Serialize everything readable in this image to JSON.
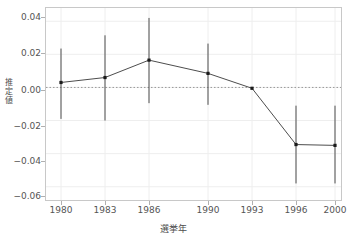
{
  "chart_data": {
    "type": "line",
    "title": "",
    "xlabel": "選挙年",
    "ylabel": "推定値",
    "ylabel_chars": [
      "推",
      "定",
      "値"
    ],
    "categories": [
      "1980",
      "1983",
      "1986",
      "1990",
      "1993",
      "1996",
      "2000"
    ],
    "x": [
      1980,
      1983,
      1986,
      1990,
      1993,
      1996,
      2000
    ],
    "values": [
      0.003,
      0.006,
      0.0165,
      0.0085,
      -0.0005,
      -0.0345,
      -0.035
    ],
    "ci_lower": [
      -0.019,
      -0.02,
      -0.0095,
      -0.0105,
      null,
      -0.058,
      -0.058
    ],
    "ci_upper": [
      0.0235,
      0.0315,
      0.042,
      0.0265,
      null,
      -0.011,
      -0.011
    ],
    "ylim": [
      -0.068,
      0.048
    ],
    "yticks": [
      0.04,
      0.02,
      0.0,
      -0.02,
      -0.04,
      -0.06
    ],
    "ytick_labels": [
      "0.04",
      "0.02",
      "0.00",
      "−0.02",
      "−0.04",
      "−0.06"
    ],
    "xtick_labels": [
      "1980",
      "1983",
      "1986",
      "1990",
      "1993",
      "1996",
      "2000"
    ],
    "grid": true,
    "legend": "none",
    "reference_line": {
      "value": 0.0,
      "style": "dotted"
    },
    "colors": {
      "line": "#4d4d4d",
      "point": "#1a1a1a",
      "errorbar": "#4d4d4d",
      "grid": "#eeeeee",
      "panel_border": "#c8c8c8",
      "text": "#4d4d4d",
      "reference_line": "#999999",
      "background": "#ffffff"
    }
  }
}
